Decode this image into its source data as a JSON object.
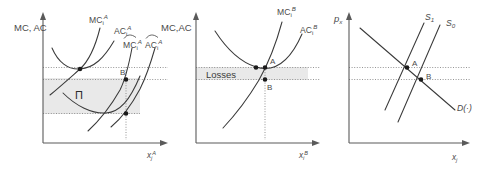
{
  "figure": {
    "background_color": "#ffffff",
    "curve_color": "#3a3a3a",
    "axis_color": "#5a5a5a",
    "shade_color": "#e9e9e9",
    "point_color": "#1a1a1a"
  },
  "panels": [
    {
      "id": "panel-a",
      "y_axis_label": "MC, AC",
      "x_axis_label_base": "x",
      "x_axis_label_sub": "j",
      "x_axis_label_sup": "A",
      "curves": [
        {
          "name": "mc-i-a",
          "base": "MC",
          "sub": "i",
          "sup": "A",
          "hat": false
        },
        {
          "name": "ac-i-a",
          "base": "AC",
          "sub": "i",
          "sup": "A",
          "hat": false
        },
        {
          "name": "mc-hat-i-a",
          "base": "MC",
          "sub": "i",
          "sup": "A",
          "hat": true
        },
        {
          "name": "ac-hat-i-a",
          "base": "AC",
          "sub": "i",
          "sup": "A",
          "hat": true
        }
      ],
      "region_label": "Π",
      "points": [
        "B"
      ]
    },
    {
      "id": "panel-b",
      "y_axis_label": "MC,AC",
      "x_axis_label_base": "x",
      "x_axis_label_sub": "i",
      "x_axis_label_sup": "B",
      "curves": [
        {
          "name": "mc-i-b",
          "base": "MC",
          "sub": "i",
          "sup": "B",
          "hat": false
        },
        {
          "name": "ac-i-b",
          "base": "AC",
          "sub": "i",
          "sup": "B",
          "hat": false
        }
      ],
      "region_label": "Losses",
      "points": [
        "A",
        "B"
      ]
    },
    {
      "id": "panel-c",
      "y_axis_label_base": "p",
      "y_axis_label_sub": "x",
      "x_axis_label_base": "x",
      "x_axis_label_sub": "j",
      "curves": [
        {
          "name": "supply-1",
          "base": "S",
          "sub": "1",
          "hat": false
        },
        {
          "name": "supply-0",
          "base": "S",
          "sub": "0",
          "hat": false
        },
        {
          "name": "demand",
          "base": "D(·)",
          "sub": "",
          "hat": false
        }
      ],
      "points": [
        "A",
        "B"
      ]
    }
  ]
}
